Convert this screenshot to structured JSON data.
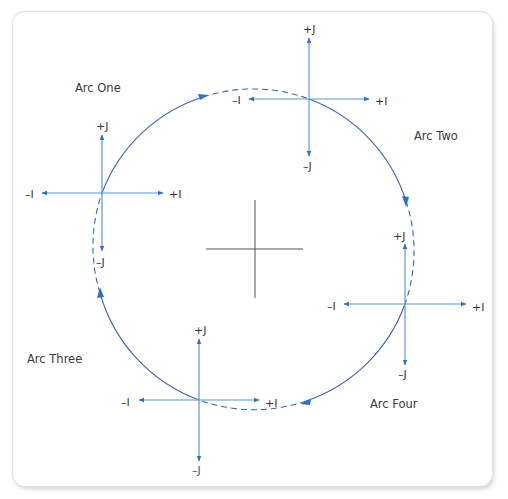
{
  "colors": {
    "axis_line": "#5f95d6",
    "arrowhead": "#2f6fc6",
    "arc": "#3a66ad",
    "center_cross": "#555555",
    "label_text": "#333333"
  },
  "arc_labels": {
    "one": "Arc One",
    "two": "Arc Two",
    "three": "Arc Three",
    "four": "Arc Four"
  },
  "crosses": {
    "left": {
      "plus_j": "+J",
      "minus_j": "–J",
      "plus_i": "+I",
      "minus_i": "–I"
    },
    "top": {
      "plus_j": "+J",
      "minus_j": "–J",
      "plus_i": "+I",
      "minus_i": "–I"
    },
    "right": {
      "plus_j": "+J",
      "minus_j": "–J",
      "plus_i": "+I",
      "minus_i": "–I"
    },
    "bottom": {
      "plus_j": "+J",
      "minus_j": "–J",
      "plus_i": "+I",
      "minus_i": "–I"
    }
  }
}
